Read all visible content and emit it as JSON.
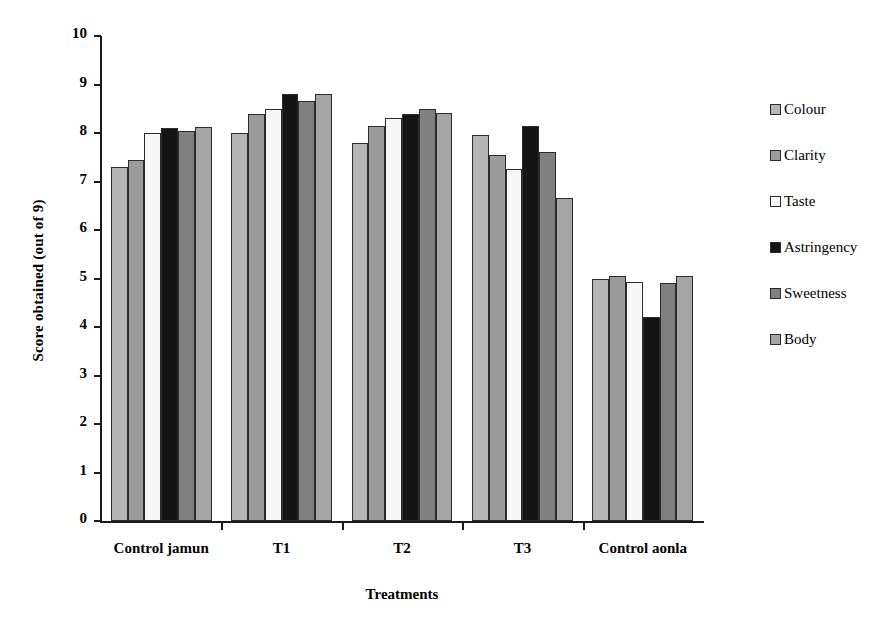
{
  "chart_data": {
    "type": "bar",
    "title": "",
    "xlabel": "Treatments",
    "ylabel": "Score obtained (out of  9)",
    "categories": [
      "Control jamun",
      "T1",
      "T2",
      "T3",
      "Control aonla"
    ],
    "ylim": [
      0,
      10
    ],
    "y_ticks": [
      0,
      1,
      2,
      3,
      4,
      5,
      6,
      7,
      8,
      9,
      10
    ],
    "grid": false,
    "legend_position": "right",
    "series": [
      {
        "name": "Colour",
        "color": "#b5b5b5",
        "values": [
          7.3,
          8.0,
          7.8,
          7.95,
          5.0
        ]
      },
      {
        "name": "Clarity",
        "color": "#9b9b9b",
        "values": [
          7.45,
          8.4,
          8.15,
          7.55,
          5.05
        ]
      },
      {
        "name": "Taste",
        "color": "#f7f7f7",
        "values": [
          8.0,
          8.5,
          8.3,
          7.25,
          4.93
        ]
      },
      {
        "name": "Astringency",
        "color": "#141414",
        "values": [
          8.1,
          8.8,
          8.4,
          8.15,
          4.2
        ]
      },
      {
        "name": "Sweetness",
        "color": "#808080",
        "values": [
          8.05,
          8.65,
          8.5,
          7.6,
          4.9
        ]
      },
      {
        "name": "Body",
        "color": "#a5a5a5",
        "values": [
          8.13,
          8.8,
          8.42,
          6.65,
          5.05
        ]
      }
    ]
  }
}
